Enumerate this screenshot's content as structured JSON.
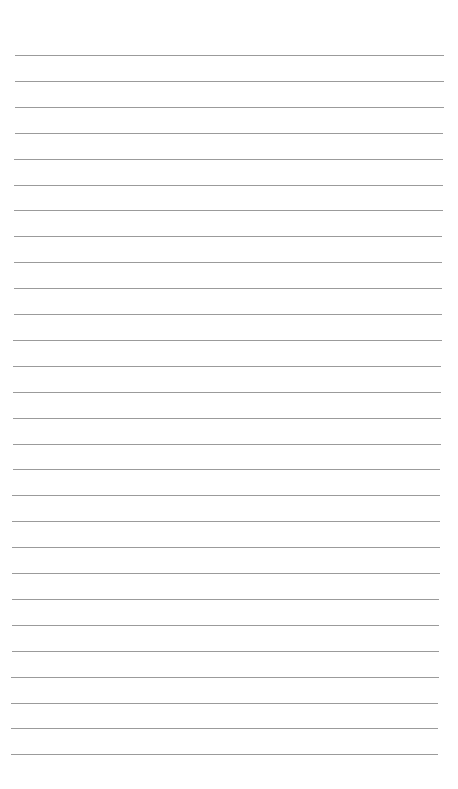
{
  "page": {
    "type": "lined paper",
    "background_color": "#ffffff",
    "line_color": "#8a8a8a",
    "line_count": 28,
    "first_line_y": 55,
    "line_spacing": 25.9,
    "line_left": 15,
    "line_right": 444
  }
}
